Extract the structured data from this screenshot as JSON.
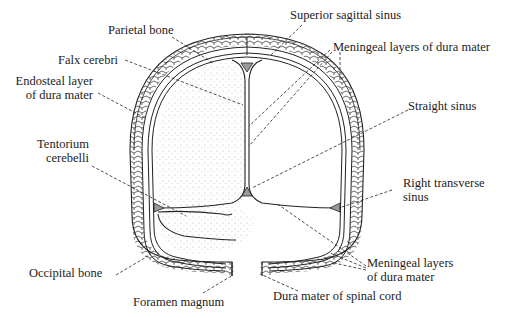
{
  "diagram": {
    "labels": {
      "parietal_bone": "Parietal bone",
      "superior_sagittal_sinus": "Superior sagittal sinus",
      "falx_cerebri": "Falx cerebri",
      "meningeal_layers_top": "Meningeal layers of dura mater",
      "endosteal_layer_line1": "Endosteal layer",
      "endosteal_layer_line2": "of dura mater",
      "straight_sinus": "Straight sinus",
      "tentorium_line1": "Tentorium",
      "tentorium_line2": "cerebelli",
      "right_transverse_line1": "Right transverse",
      "right_transverse_line2": "sinus",
      "meningeal_layers_bottom_line1": "Meningeal layers",
      "meningeal_layers_bottom_line2": "of dura mater",
      "occipital_bone": "Occipital bone",
      "foramen_magnum": "Foramen magnum",
      "dura_spinal_cord": "Dura mater of spinal cord"
    },
    "colors": {
      "line": "#222222",
      "stipple": "#8a8a8a",
      "sinus_fill": "#9a9a9a",
      "background": "#ffffff"
    }
  }
}
